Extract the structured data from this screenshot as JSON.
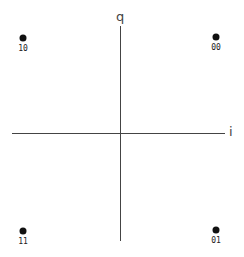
{
  "diagram": {
    "axes": {
      "vertical_label": "q",
      "horizontal_label": "i"
    },
    "points": [
      {
        "symbol": "10",
        "quadrant": "top-left",
        "x": 23,
        "y": 38
      },
      {
        "symbol": "00",
        "quadrant": "top-right",
        "x": 216,
        "y": 37
      },
      {
        "symbol": "11",
        "quadrant": "bottom-left",
        "x": 23,
        "y": 231
      },
      {
        "symbol": "01",
        "quadrant": "bottom-right",
        "x": 216,
        "y": 230
      }
    ],
    "colors": {
      "axis": "#444444",
      "point": "#111111",
      "background": "#ffffff"
    }
  }
}
